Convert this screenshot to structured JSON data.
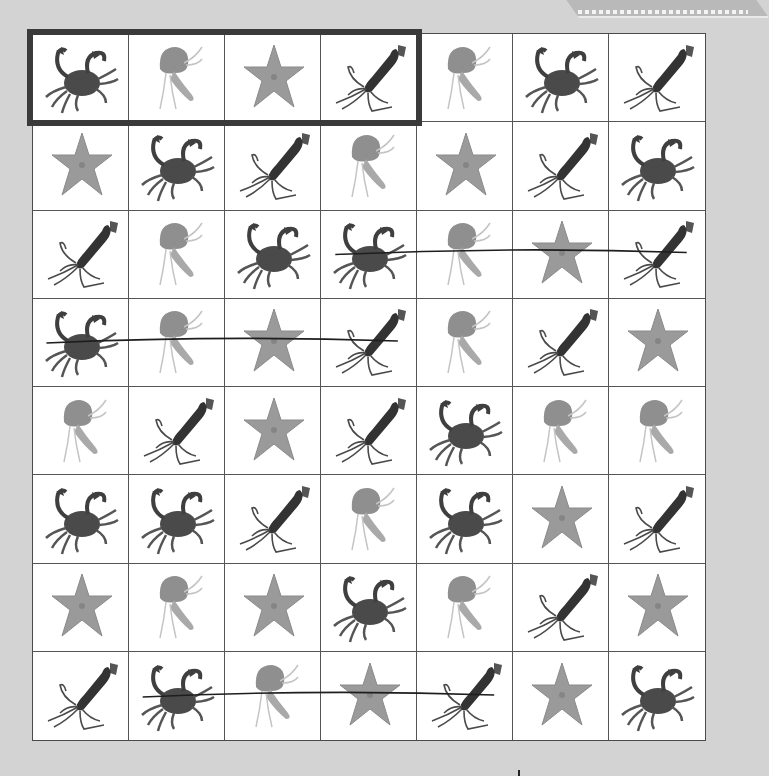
{
  "worksheet": {
    "legend": {
      "crab": "crab",
      "jellyfish": "jellyfish",
      "starfish": "starfish",
      "squid": "squid"
    },
    "target_sequence": [
      "crab",
      "jellyfish",
      "starfish",
      "squid"
    ],
    "target_highlight": {
      "row": 0,
      "col_start": 0,
      "col_end": 3
    },
    "grid": [
      [
        "crab",
        "jellyfish",
        "starfish",
        "squid",
        "jellyfish",
        "crab",
        "squid"
      ],
      [
        "starfish",
        "crab",
        "squid",
        "jellyfish",
        "starfish",
        "squid",
        "crab"
      ],
      [
        "squid",
        "jellyfish",
        "crab",
        "crab",
        "jellyfish",
        "starfish",
        "squid"
      ],
      [
        "crab",
        "jellyfish",
        "starfish",
        "squid",
        "jellyfish",
        "squid",
        "starfish"
      ],
      [
        "jellyfish",
        "squid",
        "starfish",
        "squid",
        "crab",
        "jellyfish",
        "jellyfish"
      ],
      [
        "crab",
        "crab",
        "squid",
        "jellyfish",
        "crab",
        "starfish",
        "squid"
      ],
      [
        "starfish",
        "jellyfish",
        "starfish",
        "crab",
        "jellyfish",
        "squid",
        "starfish"
      ],
      [
        "squid",
        "crab",
        "jellyfish",
        "starfish",
        "squid",
        "starfish",
        "crab"
      ]
    ],
    "found_lines": [
      {
        "row": 2,
        "col_start": 3,
        "col_end": 6
      },
      {
        "row": 3,
        "col_start": 0,
        "col_end": 3
      },
      {
        "row": 7,
        "col_start": 1,
        "col_end": 4
      }
    ],
    "colors": {
      "background": "#d3d3d3",
      "grid_line": "#555555",
      "highlight_border": "#3a3a3a",
      "pen_line": "#1e1e1e"
    }
  }
}
